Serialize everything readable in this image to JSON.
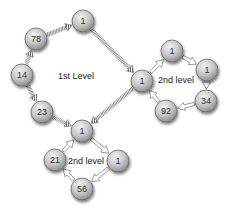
{
  "diagram": {
    "type": "hierarchical-ring-network",
    "colors": {
      "node_fill_light": "#e4e4e4",
      "node_fill_dark": "#9a9a9a",
      "node_stroke": "#6a6a6a",
      "hatched_edge": "#6e6e6e",
      "hollow_arrow_stroke": "#808080",
      "background": "#ffffff"
    },
    "labels": [
      {
        "id": "first-level",
        "text": "1st Level",
        "x": 58,
        "y": 79
      },
      {
        "id": "second-level-right",
        "text": "2nd level",
        "x": 158,
        "y": 83
      },
      {
        "id": "second-level-bottom",
        "text": "2nd level",
        "x": 68,
        "y": 164
      }
    ],
    "nodes": [
      {
        "id": "n78",
        "value": "78",
        "x": 36,
        "y": 39,
        "ring": "1st Level"
      },
      {
        "id": "n1top",
        "value": "1",
        "x": 83,
        "y": 21,
        "ring": "1st Level"
      },
      {
        "id": "n1hubR",
        "value": "1",
        "x": 142,
        "y": 81,
        "ring": "1st Level / 2nd level (right)"
      },
      {
        "id": "n1hubB",
        "value": "1",
        "x": 82,
        "y": 131,
        "ring": "1st Level / 2nd level (bottom)"
      },
      {
        "id": "n23",
        "value": "23",
        "x": 42,
        "y": 112,
        "ring": "1st Level"
      },
      {
        "id": "n14",
        "value": "14",
        "x": 22,
        "y": 75,
        "ring": "1st Level"
      },
      {
        "id": "n1rt",
        "value": "1",
        "x": 172,
        "y": 51,
        "ring": "2nd level (right)"
      },
      {
        "id": "n1rr",
        "value": "1",
        "x": 207,
        "y": 70,
        "ring": "2nd level (right)"
      },
      {
        "id": "n34",
        "value": "34",
        "x": 206,
        "y": 101,
        "ring": "2nd level (right)"
      },
      {
        "id": "n92",
        "value": "92",
        "x": 166,
        "y": 111,
        "ring": "2nd level (right)"
      },
      {
        "id": "n1br",
        "value": "1",
        "x": 118,
        "y": 161,
        "ring": "2nd level (bottom)"
      },
      {
        "id": "n56",
        "value": "56",
        "x": 82,
        "y": 189,
        "ring": "2nd level (bottom)"
      },
      {
        "id": "n21",
        "value": "21",
        "x": 55,
        "y": 160,
        "ring": "2nd level (bottom)"
      }
    ],
    "edges": [
      {
        "from": "n78",
        "to": "n1top",
        "style": "hatched"
      },
      {
        "from": "n1top",
        "to": "n1hubR",
        "style": "hatched"
      },
      {
        "from": "n1hubR",
        "to": "n1hubB",
        "style": "hatched"
      },
      {
        "from": "n23",
        "to": "n1hubB",
        "style": "hatched"
      },
      {
        "from": "n14",
        "to": "n23",
        "style": "hatched"
      },
      {
        "from": "n14",
        "to": "n78",
        "style": "hatched"
      },
      {
        "from": "n1hubR",
        "to": "n1rt",
        "style": "hollow"
      },
      {
        "from": "n1rt",
        "to": "n1rr",
        "style": "hollow"
      },
      {
        "from": "n1rr",
        "to": "n34",
        "style": "hollow"
      },
      {
        "from": "n34",
        "to": "n92",
        "style": "hollow"
      },
      {
        "from": "n92",
        "to": "n1hubR",
        "style": "hollow"
      },
      {
        "from": "n1hubB",
        "to": "n1br",
        "style": "hollow"
      },
      {
        "from": "n1br",
        "to": "n56",
        "style": "hollow"
      },
      {
        "from": "n56",
        "to": "n21",
        "style": "hollow"
      },
      {
        "from": "n21",
        "to": "n1hubB",
        "style": "hollow"
      }
    ]
  }
}
